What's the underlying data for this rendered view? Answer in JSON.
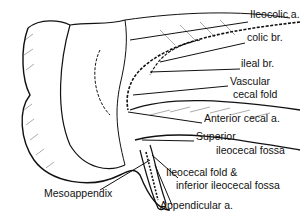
{
  "diagram": {
    "labels": [
      {
        "id": "ileocolic",
        "text": "Ileocolic a.",
        "x": 250,
        "y": 14
      },
      {
        "id": "colic-br",
        "text": "colic br.",
        "x": 247,
        "y": 37
      },
      {
        "id": "ileal-br",
        "text": "ileal br.",
        "x": 241,
        "y": 63
      },
      {
        "id": "vascular",
        "text": "Vascular",
        "x": 230,
        "y": 81
      },
      {
        "id": "vascular2",
        "text": "cecal fold",
        "x": 233,
        "y": 94
      },
      {
        "id": "anterior",
        "text": "Anterior cecal a.",
        "x": 204,
        "y": 118
      },
      {
        "id": "superior",
        "text": "Superior",
        "x": 196,
        "y": 136
      },
      {
        "id": "superior2",
        "text": "ileocecal fossa",
        "x": 216,
        "y": 150
      },
      {
        "id": "ileocecal-fold",
        "text": "Ileocecal fold &",
        "x": 166,
        "y": 172
      },
      {
        "id": "ileocecal-fold2",
        "text": "inferior ileocecal fossa",
        "x": 176,
        "y": 185
      },
      {
        "id": "mesoappendix",
        "text": "Mesoappendix",
        "x": 44,
        "y": 193
      },
      {
        "id": "appendicular",
        "text": "Appendicular a.",
        "x": 160,
        "y": 205
      }
    ]
  }
}
